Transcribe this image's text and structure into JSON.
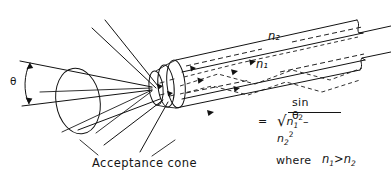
{
  "figure": {
    "kind": "technical-line-drawing",
    "subject": "Optical fiber acceptance cone and numerical aperture",
    "background_color": "#ffffff",
    "ink_color": "#121212"
  },
  "labels": {
    "acceptance_cone": "Acceptance cone",
    "theta": "θ",
    "n2_fiber": "n₂",
    "n1_fiber": "n₁",
    "where": "where"
  },
  "formula": {
    "sin_theta": "sin θ",
    "equals": "=",
    "radical_sign": "√",
    "radicand_n1": "n",
    "radicand_n1_sub": "1",
    "radicand_n1_sup": "2",
    "minus": "–",
    "radicand_n2": "n",
    "radicand_n2_sub": "2",
    "radicand_n2_sup": "2",
    "full_text": "sin θ = √(n₁² – n₂²)"
  },
  "condition": {
    "n1": "n",
    "n1_sub": "1",
    "operator": ">",
    "n2": "n",
    "n2_sub": "2",
    "full_text": "n₁ > n₂"
  },
  "parts": {
    "cone": "acceptance-cone-shape",
    "cone_base_ellipse": "cone-base-ellipse",
    "fiber_body": "optical-fiber-body",
    "ferrule": "fiber-connector-ferrule",
    "core_axis": "fiber-core-axis",
    "angle_arc": "acceptance-angle-arc",
    "ray_paths": "internally-reflected-ray-paths",
    "leader_lines": "label-leader-lines",
    "broken_end": "fiber-broken-away-end"
  }
}
